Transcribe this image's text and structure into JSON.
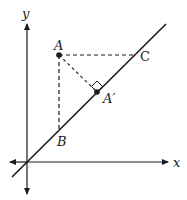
{
  "diagram": {
    "axes": {
      "x_label": "x",
      "y_label": "y"
    },
    "line": {
      "description": "line y = x through origin"
    },
    "points": {
      "A": {
        "label": "A"
      },
      "A_prime": {
        "label": "A′"
      },
      "B": {
        "label": "B"
      },
      "C": {
        "label": "C"
      }
    },
    "segments": [
      {
        "from": "A",
        "to": "B",
        "style": "dashed"
      },
      {
        "from": "A",
        "to": "C",
        "style": "dashed"
      },
      {
        "from": "A",
        "to": "A_prime",
        "style": "dashed"
      }
    ],
    "right_angle_at": "A_prime",
    "colors": {
      "stroke": "#1a1a1a",
      "background": "#ffffff"
    }
  }
}
